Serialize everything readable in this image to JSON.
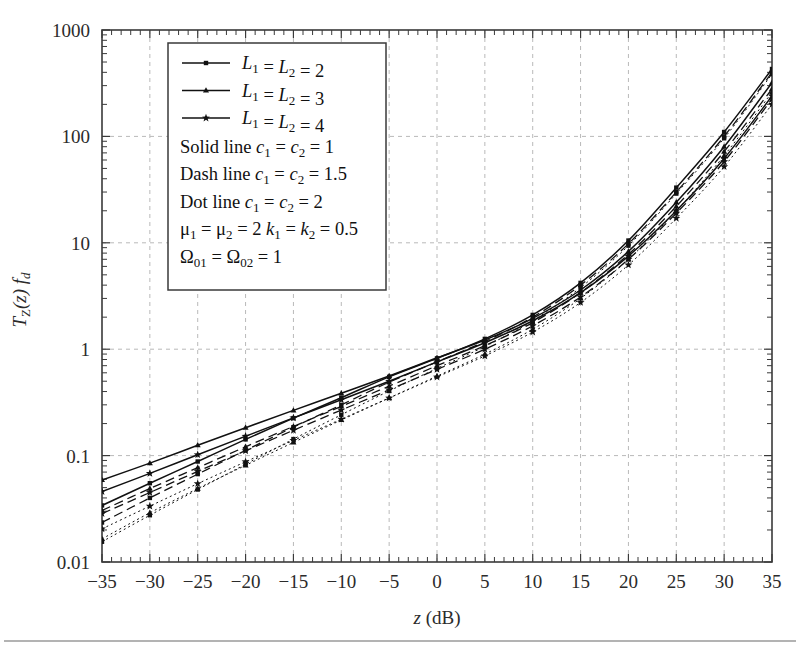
{
  "figure": {
    "background": "#ffffff",
    "line_color": "#111111",
    "grid_color": "#b9b9b9",
    "axis_color": "#3a3a3a"
  },
  "axes": {
    "x_label": "z (dB)",
    "x_label_italic_part": "z",
    "x_label_rest": " (dB)",
    "y_label": "TZ(z) fd",
    "x_ticks": [
      "-35",
      "-30",
      "-25",
      "-20",
      "-15",
      "-10",
      "-5",
      "0",
      "5",
      "10",
      "15",
      "20",
      "25",
      "30",
      "35"
    ],
    "x_tick_values": [
      -35,
      -30,
      -25,
      -20,
      -15,
      -10,
      -5,
      0,
      5,
      10,
      15,
      20,
      25,
      30,
      35
    ],
    "y_ticks": [
      "0.01",
      "0.1",
      "1",
      "10",
      "100",
      "1000"
    ],
    "y_tick_values": [
      0.01,
      0.1,
      1,
      10,
      100,
      1000
    ],
    "x_range": [
      -35,
      35
    ],
    "y_range": [
      0.01,
      1000
    ],
    "y_scale": "log",
    "grid": "dashed-both"
  },
  "legend": {
    "entries": [
      {
        "marker": "square",
        "label": "L1 = L2 = 2",
        "label_plain": "L₁ = L₂ = 2"
      },
      {
        "marker": "triangle",
        "label": "L1 = L2 = 3",
        "label_plain": "L₁ = L₂ = 3"
      },
      {
        "marker": "star",
        "label": "L1 = L2 = 4",
        "label_plain": "L₁ = L₂ = 4"
      }
    ],
    "notes": [
      "Solid line c1 = c2 = 1",
      "Dash line c1 = c2 = 1.5",
      "Dot line c1 = c2 = 2",
      "μ1 = μ2 = 2 k1 = k2 = 0.5",
      "Ω01 = Ω02 = 1"
    ]
  },
  "chart_data": {
    "type": "line",
    "title": "",
    "xlabel": "z (dB)",
    "ylabel": "T_Z(z) f_d",
    "xlim": [
      -35,
      35
    ],
    "ylim": [
      0.01,
      1000
    ],
    "yscale": "log",
    "xscale": "linear",
    "grid": true,
    "legend_position": "upper-left-inside",
    "x": [
      -35,
      -30,
      -25,
      -20,
      -15,
      -10,
      -5,
      0,
      5,
      10,
      15,
      20,
      25,
      30,
      35
    ],
    "series": [
      {
        "name": "L1=L2=2, c1=c2=1",
        "marker": "square",
        "linestyle": "solid",
        "values": [
          0.034,
          0.055,
          0.088,
          0.142,
          0.225,
          0.35,
          0.55,
          0.82,
          1.25,
          2.1,
          4.2,
          10.5,
          33,
          110,
          430
        ]
      },
      {
        "name": "L1=L2=3, c1=c2=1",
        "marker": "triangle",
        "linestyle": "solid",
        "values": [
          0.059,
          0.085,
          0.125,
          0.183,
          0.266,
          0.385,
          0.56,
          0.83,
          1.22,
          1.95,
          3.6,
          8.3,
          24,
          80,
          320
        ]
      },
      {
        "name": "L1=L2=4, c1=c2=1",
        "marker": "star",
        "linestyle": "solid",
        "values": [
          0.046,
          0.068,
          0.102,
          0.152,
          0.226,
          0.335,
          0.5,
          0.76,
          1.15,
          1.85,
          3.4,
          7.5,
          20,
          62,
          240
        ]
      },
      {
        "name": "L1=L2=2, c1=c2=1.5",
        "marker": "square",
        "linestyle": "dashed",
        "values": [
          0.0235,
          0.04,
          0.067,
          0.112,
          0.185,
          0.3,
          0.49,
          0.76,
          1.18,
          2.0,
          4.0,
          9.8,
          30,
          100,
          400
        ]
      },
      {
        "name": "L1=L2=3, c1=c2=1.5",
        "marker": "triangle",
        "linestyle": "dashed",
        "values": [
          0.0305,
          0.049,
          0.077,
          0.121,
          0.188,
          0.29,
          0.45,
          0.7,
          1.08,
          1.78,
          3.4,
          7.8,
          22,
          72,
          280
        ]
      },
      {
        "name": "L1=L2=4, c1=c2=1.5",
        "marker": "star",
        "linestyle": "dashed",
        "values": [
          0.0285,
          0.045,
          0.071,
          0.111,
          0.173,
          0.268,
          0.415,
          0.645,
          1.0,
          1.66,
          3.1,
          7.0,
          19,
          58,
          225
        ]
      },
      {
        "name": "L1=L2=2, c1=c2=2",
        "marker": "square",
        "linestyle": "dotted",
        "values": [
          0.0155,
          0.0275,
          0.048,
          0.083,
          0.143,
          0.242,
          0.405,
          0.66,
          1.06,
          1.85,
          3.8,
          9.4,
          29,
          96,
          385
        ]
      },
      {
        "name": "L1=L2=3, c1=c2=2",
        "marker": "triangle",
        "linestyle": "dotted",
        "values": [
          0.0165,
          0.029,
          0.049,
          0.081,
          0.133,
          0.216,
          0.348,
          0.558,
          0.9,
          1.54,
          3.0,
          7.0,
          20,
          66,
          260
        ]
      },
      {
        "name": "L1=L2=4, c1=c2=2",
        "marker": "star",
        "linestyle": "dotted",
        "values": [
          0.0205,
          0.0335,
          0.0545,
          0.0875,
          0.139,
          0.22,
          0.348,
          0.548,
          0.865,
          1.45,
          2.75,
          6.2,
          17,
          52,
          200
        ]
      }
    ]
  }
}
